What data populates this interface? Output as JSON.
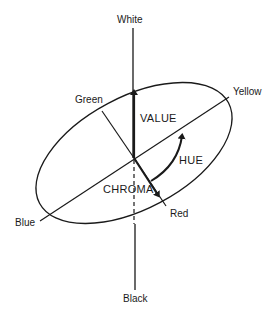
{
  "diagram": {
    "type": "color-solid-diagram",
    "poles": {
      "top": "White",
      "bottom": "Black"
    },
    "hues": {
      "green": "Green",
      "yellow": "Yellow",
      "blue": "Blue",
      "red": "Red"
    },
    "dimensions": {
      "value": "VALUE",
      "hue": "HUE",
      "chroma": "CHROMA"
    },
    "colors": {
      "stroke": "#1a1a1a",
      "background": "#ffffff"
    }
  }
}
